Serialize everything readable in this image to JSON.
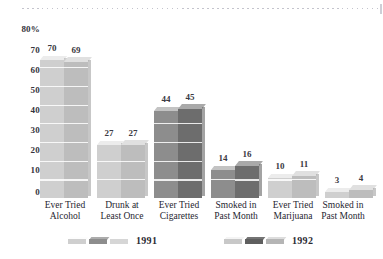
{
  "chart_data": {
    "type": "bar",
    "title": "",
    "xlabel": "",
    "ylabel": "",
    "ylim": [
      0,
      80
    ],
    "grid": true,
    "legend_position": "bottom",
    "yticks": [
      "80%",
      "70",
      "60",
      "50",
      "40",
      "30",
      "20",
      "10",
      "0"
    ],
    "categories": [
      "Ever Tried Alcohol",
      "Drunk at Least Once",
      "Ever Tried Cigarettes",
      "Smoked in Past Month",
      "Ever Tried Marijuana",
      "Smoked in Past Month"
    ],
    "category_lines": [
      [
        "Ever Tried",
        "Alcohol"
      ],
      [
        "Drunk at",
        "Least Once"
      ],
      [
        "Ever Tried",
        "Cigarettes"
      ],
      [
        "Smoked in",
        "Past Month"
      ],
      [
        "Ever Tried",
        "Marijuana"
      ],
      [
        "Smoked in",
        "Past Month"
      ]
    ],
    "series": [
      {
        "name": "1991",
        "values": [
          70,
          27,
          44,
          14,
          10,
          3
        ]
      },
      {
        "name": "1992",
        "values": [
          69,
          27,
          45,
          16,
          11,
          4
        ]
      }
    ],
    "bar_colors": {
      "light_1991": "#cfcfcf",
      "light_1992": "#bdbdbd",
      "dark_1991": "#8d8d8d",
      "dark_1992": "#6d6d6d",
      "top_light": "#ececec",
      "top_dark": "#bcbcbc"
    }
  },
  "legend": {
    "entries": [
      {
        "label": "1991",
        "swatches": [
          "#cfcfcf",
          "#8d8d8d",
          "#d6d6d6"
        ]
      },
      {
        "label": "1992",
        "swatches": [
          "#c8c8c8",
          "#5f5f5f",
          "#b5b5b5"
        ]
      }
    ]
  }
}
